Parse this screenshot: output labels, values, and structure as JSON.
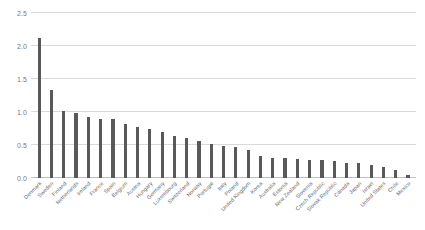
{
  "chart_data": {
    "type": "bar",
    "title": "",
    "subtitle": "",
    "xlabel": "",
    "ylabel": "",
    "ylim": [
      0,
      2.5
    ],
    "ytick_labels": [
      "0.0",
      "0.5",
      "1.0",
      "1.5",
      "2.0",
      "2.5"
    ],
    "ytick_values": [
      0,
      0.5,
      1.0,
      1.5,
      2.0,
      2.5
    ],
    "grid": true,
    "legend": false,
    "bar_color": "#595959",
    "gridline_color": "#d9d9d9",
    "axis_label_color": "#6b6b6b",
    "categories": [
      "Denmark",
      "Sweden",
      "Finland",
      "Netherlands",
      "Ireland",
      "France",
      "Spain",
      "Belgium",
      "Austria",
      "Hungary",
      "Germany",
      "Luxembourg",
      "Switzerland",
      "Norway",
      "Portugal",
      "Italy",
      "Poland",
      "United Kingdom",
      "Korea",
      "Australia",
      "Estonia",
      "New Zealand",
      "Slovenia",
      "Czech Republic",
      "Slovak Republic",
      "Canada",
      "Japan",
      "Israel",
      "United States",
      "Chile",
      "Mexico"
    ],
    "values": [
      2.12,
      1.33,
      1.02,
      0.98,
      0.93,
      0.9,
      0.9,
      0.82,
      0.77,
      0.75,
      0.7,
      0.63,
      0.61,
      0.56,
      0.52,
      0.48,
      0.47,
      0.42,
      0.33,
      0.31,
      0.3,
      0.29,
      0.28,
      0.27,
      0.26,
      0.23,
      0.22,
      0.2,
      0.17,
      0.12,
      0.04
    ]
  }
}
